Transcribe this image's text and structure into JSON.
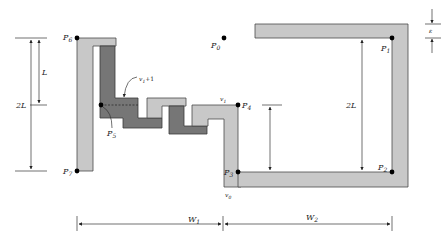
{
  "diagram": {
    "points": {
      "P0": "P",
      "P0_sub": "0",
      "P1": "P",
      "P1_sub": "1",
      "P2": "P",
      "P2_sub": "2",
      "P3": "P",
      "P3_sub": "3",
      "P4": "P",
      "P4_sub": "4",
      "P5": "P",
      "P5_sub": "5",
      "P6": "P",
      "P6_sub": "6",
      "P7": "P",
      "P7_sub": "7"
    },
    "vertex_labels": {
      "v0": "v",
      "v0_sub": "0",
      "v1": "v",
      "v1_sub": "1",
      "v1_plus_1": "+1"
    },
    "dimensions": {
      "L": "L",
      "two_L_left": "2L",
      "two_L_right": "2L",
      "W1": "W",
      "W1_sub": "1",
      "W2": "W",
      "W2_sub": "2",
      "epsilon": "ε"
    },
    "colors": {
      "light_fill": "#c8c8c8",
      "dark_fill": "#767676",
      "outline": "#4a4a4a"
    }
  }
}
